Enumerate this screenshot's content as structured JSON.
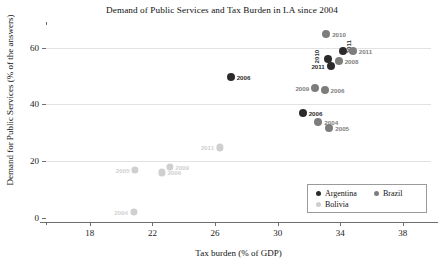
{
  "chart_data": {
    "type": "scatter",
    "title": "Demand of Public Services and Tax Burden in LA since 2004",
    "xlabel": "Tax burden (% of GDP)",
    "ylabel": "Demand for Public Services (% of the answers)",
    "xlim": [
      15.2,
      39.8
    ],
    "ylim": [
      -1.5,
      68
    ],
    "xticks": [
      18,
      22,
      26,
      30,
      34,
      38
    ],
    "yticks": [
      0,
      20,
      40,
      60
    ],
    "grid": "horizontal",
    "legend_position": "lower right",
    "colors": {
      "Argentina": "#2b2b2b",
      "Brazil": "#7d7d7d",
      "Bolivia": "#cfcfcf"
    },
    "series": [
      {
        "name": "Argentina",
        "color": "#2b2b2b",
        "points": [
          {
            "label": "2006",
            "x": 27.0,
            "y": 49.5,
            "label_pos": "right"
          },
          {
            "label": "2006",
            "x": 31.6,
            "y": 36.8,
            "label_pos": "right"
          },
          {
            "label": "2010",
            "x": 33.2,
            "y": 56.0,
            "label_pos": "left-rot"
          },
          {
            "label": "2011",
            "x": 33.4,
            "y": 53.5,
            "label_pos": "left"
          },
          {
            "label": "2011",
            "x": 34.2,
            "y": 58.8,
            "label_pos": "right-rot"
          }
        ]
      },
      {
        "name": "Brazil",
        "color": "#7d7d7d",
        "points": [
          {
            "label": "2004",
            "x": 32.6,
            "y": 33.8,
            "label_pos": "right"
          },
          {
            "label": "2005",
            "x": 33.3,
            "y": 31.8,
            "label_pos": "right"
          },
          {
            "label": "2006",
            "x": 33.0,
            "y": 45.0,
            "label_pos": "right"
          },
          {
            "label": "2009",
            "x": 32.4,
            "y": 45.8,
            "label_pos": "left"
          },
          {
            "label": "2008",
            "x": 33.9,
            "y": 55.2,
            "label_pos": "right"
          },
          {
            "label": "2010",
            "x": 33.1,
            "y": 64.8,
            "label_pos": "right"
          },
          {
            "label": "2011",
            "x": 34.8,
            "y": 58.7,
            "label_pos": "right"
          }
        ]
      },
      {
        "name": "Bolivia",
        "color": "#cfcfcf",
        "points": [
          {
            "label": "2004",
            "x": 20.8,
            "y": 2.0,
            "label_pos": "left"
          },
          {
            "label": "2005",
            "x": 20.9,
            "y": 16.8,
            "label_pos": "left"
          },
          {
            "label": "2006",
            "x": 22.6,
            "y": 16.0,
            "label_pos": "right"
          },
          {
            "label": "2009",
            "x": 23.1,
            "y": 17.8,
            "label_pos": "right"
          },
          {
            "label": "2011",
            "x": 26.3,
            "y": 24.8,
            "label_pos": "left"
          }
        ]
      }
    ]
  }
}
